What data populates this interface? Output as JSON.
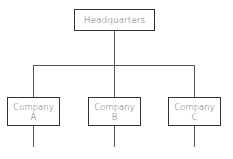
{
  "diagram": {
    "type": "org-chart",
    "root": {
      "label": "Headquarters"
    },
    "children": [
      {
        "label_line1": "Company",
        "label_line2": "A"
      },
      {
        "label_line1": "Company",
        "label_line2": "B"
      },
      {
        "label_line1": "Company",
        "label_line2": "C"
      }
    ]
  }
}
